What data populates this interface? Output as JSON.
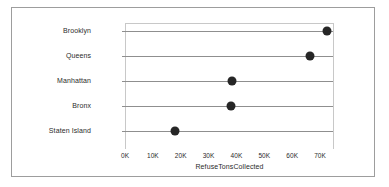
{
  "chart_data": {
    "type": "scatter",
    "subtype": "dot-plot",
    "title": "",
    "xlabel": "RefuseTonsCollected",
    "ylabel": "",
    "categories": [
      "Brooklyn",
      "Queens",
      "Manhattan",
      "Bronx",
      "Staten Island"
    ],
    "values": [
      72000,
      66000,
      38000,
      37500,
      17500
    ],
    "xlim": [
      0,
      75000
    ],
    "xticks": [
      0,
      10000,
      20000,
      30000,
      40000,
      50000,
      60000,
      70000
    ],
    "xticklabels": [
      "0K",
      "10K",
      "20K",
      "30K",
      "40K",
      "50K",
      "60K",
      "70K"
    ],
    "grid": "horizontal-rules-per-category",
    "legend": "none",
    "marker_color": "#262626",
    "rule_color": "#8f8f8f",
    "points": [
      {
        "category": "Brooklyn",
        "value": 72000
      },
      {
        "category": "Queens",
        "value": 66000
      },
      {
        "category": "Manhattan",
        "value": 38000
      },
      {
        "category": "Bronx",
        "value": 37500
      },
      {
        "category": "Staten Island",
        "value": 17500
      }
    ]
  },
  "figure": {
    "background_color": "#ffffff",
    "border_color": "#9d9d9d",
    "plot_border_color": "#c8c8c8"
  }
}
